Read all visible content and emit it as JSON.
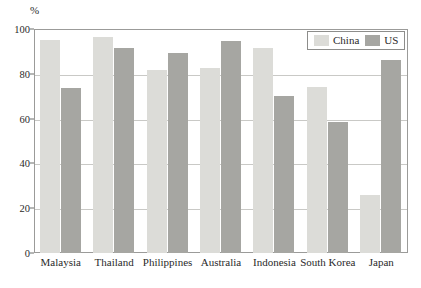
{
  "chart_data": {
    "type": "bar",
    "title": "",
    "subtitle": "",
    "xlabel": "",
    "ylabel": "%",
    "unit_label": "%",
    "ylim": [
      0,
      100
    ],
    "yticks": [
      0,
      20,
      40,
      60,
      80,
      100
    ],
    "ytick_labels": [
      "0",
      "20",
      "40",
      "60",
      "80",
      "100"
    ],
    "grid": true,
    "grid_axis": "y",
    "legend_position": "upper-right",
    "categories": [
      "Malaysia",
      "Thailand",
      "Philippines",
      "Australia",
      "Indonesia",
      "South Korea",
      "Japan"
    ],
    "series": [
      {
        "name": "China",
        "color": "#dcdcd8",
        "values": [
          95,
          96.5,
          81.5,
          82.5,
          91.5,
          74,
          26
        ]
      },
      {
        "name": "US",
        "color": "#a6a6a2",
        "values": [
          73.5,
          91.5,
          89.5,
          94.5,
          70,
          58.5,
          86
        ]
      }
    ]
  },
  "legend": {
    "entries": [
      {
        "label": "China",
        "color": "#dcdcd8"
      },
      {
        "label": "US",
        "color": "#a6a6a2"
      }
    ]
  },
  "colors": {
    "china_bar": "#dcdcd8",
    "us_bar": "#a6a6a2",
    "gridline": "#c9c9c6",
    "frame": "#9b9b99",
    "text": "#2a2a2a",
    "background": "#ffffff"
  }
}
